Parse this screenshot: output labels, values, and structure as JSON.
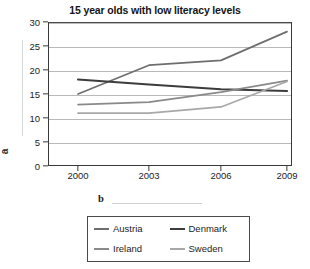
{
  "chart_data": {
    "type": "line",
    "title": "15 year olds with low literacy levels",
    "xlabel": "",
    "ylabel": "",
    "x": [
      "2000",
      "2003",
      "2006",
      "2009"
    ],
    "categories": [
      "2000",
      "2003",
      "2006",
      "2009"
    ],
    "yticks": [
      "0",
      "5",
      "10",
      "15",
      "20",
      "25",
      "30"
    ],
    "ylim": [
      0,
      30
    ],
    "grid": true,
    "legend_position": "bottom",
    "series": [
      {
        "name": "Austria",
        "values": [
          15.0,
          21.0,
          22.0,
          28.0
        ],
        "color": "#6e6e6e"
      },
      {
        "name": "Denmark",
        "values": [
          18.0,
          17.0,
          16.0,
          15.6
        ],
        "color": "#3c3c3c"
      },
      {
        "name": "Ireland",
        "values": [
          12.8,
          13.3,
          15.4,
          17.8
        ],
        "color": "#8a8a8a"
      },
      {
        "name": "Sweden",
        "values": [
          11.0,
          11.0,
          12.3,
          17.6
        ],
        "color": "#a8a8a8"
      }
    ]
  },
  "annotations": {
    "axis_letter": "a",
    "below_letter": "b"
  },
  "legend": {
    "entries": [
      {
        "label": "Austria"
      },
      {
        "label": "Denmark"
      },
      {
        "label": "Ireland"
      },
      {
        "label": "Sweden"
      }
    ]
  }
}
